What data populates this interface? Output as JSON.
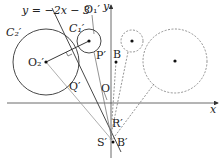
{
  "diagram": {
    "line_label": "y = −2x − 3",
    "axis_x_label": "x",
    "axis_y_label": "y",
    "points": {
      "O": "O",
      "O1p": "O₁′",
      "O2p": "O₂′",
      "C1p": "C₁′",
      "C2p": "C₂′",
      "Pp": "P′",
      "Qp": "Q′",
      "Rp": "R′",
      "Sp": "S′",
      "Bp": "B′",
      "B": "B"
    }
  }
}
